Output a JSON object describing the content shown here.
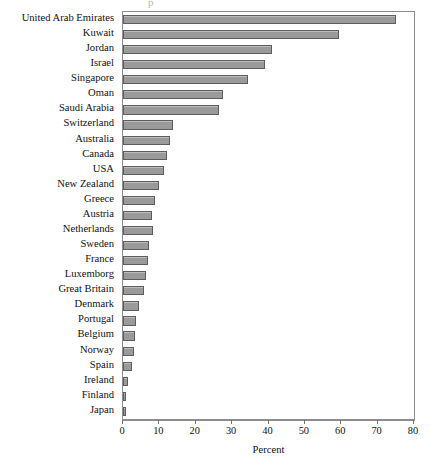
{
  "chart": {
    "type": "bar",
    "orientation": "horizontal",
    "xlabel": "Percent",
    "ylabel": "",
    "title": "",
    "title_remnant": "p",
    "grid": false,
    "legend": false
  },
  "axis": {
    "ticks": [
      {
        "value": 0,
        "label": "0"
      },
      {
        "value": 10,
        "label": "10"
      },
      {
        "value": 20,
        "label": "20"
      },
      {
        "value": 30,
        "label": "30"
      },
      {
        "value": 40,
        "label": "40"
      },
      {
        "value": 50,
        "label": "50"
      },
      {
        "value": 60,
        "label": "60"
      },
      {
        "value": 70,
        "label": "70"
      },
      {
        "value": 80,
        "label": "80"
      }
    ]
  },
  "chart_data": {
    "type": "bar",
    "title": "",
    "xlabel": "Percent",
    "ylabel": "",
    "xlim": [
      0,
      80
    ],
    "orientation": "horizontal",
    "grid": false,
    "legend_position": "none",
    "bar_color": "#9a9a9a",
    "bar_border_color": "#5d5d5d",
    "categories": [
      "United Arab Emirates",
      "Kuwait",
      "Jordan",
      "Israel",
      "Singapore",
      "Oman",
      "Saudi Arabia",
      "Switzerland",
      "Australia",
      "Canada",
      "USA",
      "New Zealand",
      "Greece",
      "Austria",
      "Netherlands",
      "Sweden",
      "France",
      "Luxemborg",
      "Great Britain",
      "Denmark",
      "Portugal",
      "Belgium",
      "Norway",
      "Spain",
      "Ireland",
      "Finland",
      "Japan"
    ],
    "values": [
      75.0,
      59.5,
      41.0,
      39.0,
      34.5,
      27.5,
      26.5,
      13.7,
      12.8,
      12.0,
      11.2,
      9.8,
      8.7,
      8.0,
      8.2,
      7.1,
      6.8,
      6.3,
      5.7,
      4.3,
      3.6,
      3.3,
      3.0,
      2.4,
      1.4,
      0.8,
      0.3
    ]
  }
}
